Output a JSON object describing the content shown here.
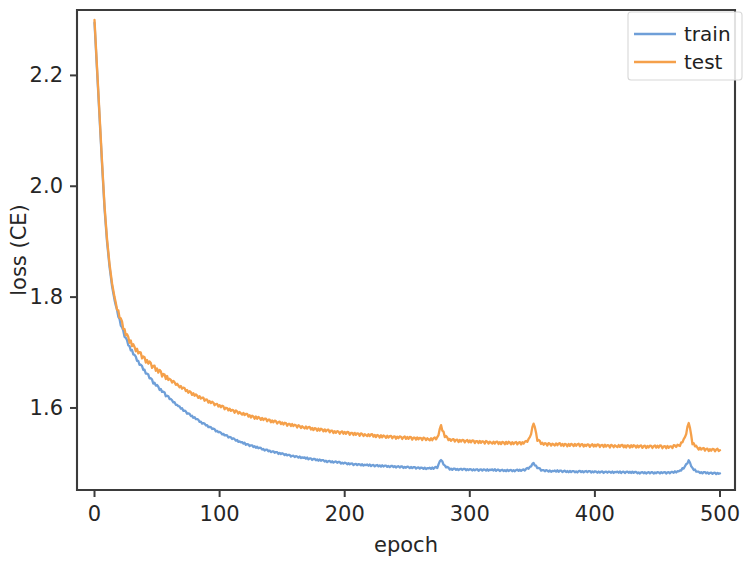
{
  "chart_data": {
    "type": "line",
    "title": "",
    "xlabel": "epoch",
    "ylabel": "loss (CE)",
    "xlim": [
      -14,
      512
    ],
    "ylim": [
      1.452,
      2.318
    ],
    "xticks": [
      0,
      100,
      200,
      300,
      400,
      500
    ],
    "xticklabels": [
      "0",
      "100",
      "200",
      "300",
      "400",
      "500"
    ],
    "yticks": [
      1.6,
      1.8,
      2.0,
      2.2
    ],
    "yticklabels": [
      "1.6",
      "1.8",
      "2.0",
      "2.2"
    ],
    "grid": false,
    "legend_position": "upper right",
    "colors": {
      "train": "#6f9fd8",
      "test": "#f5a council",
      "background": "#ffffff",
      "axis": "#3b3b3b",
      "text": "#262626"
    },
    "series": [
      {
        "name": "train",
        "color": "#6f9fd8",
        "x": [
          0,
          2,
          4,
          6,
          8,
          10,
          12,
          14,
          16,
          18,
          20,
          22,
          24,
          26,
          28,
          30,
          32,
          34,
          36,
          38,
          40,
          42,
          44,
          46,
          48,
          50,
          54,
          58,
          62,
          66,
          70,
          74,
          78,
          82,
          86,
          90,
          94,
          98,
          104,
          110,
          116,
          122,
          128,
          134,
          140,
          146,
          152,
          158,
          164,
          170,
          176,
          182,
          188,
          194,
          200,
          208,
          216,
          224,
          232,
          240,
          248,
          256,
          264,
          270,
          274,
          277,
          280,
          284,
          290,
          296,
          304,
          312,
          320,
          328,
          336,
          344,
          348,
          351,
          354,
          358,
          364,
          372,
          380,
          388,
          396,
          404,
          412,
          420,
          428,
          436,
          444,
          452,
          460,
          468,
          472,
          475,
          478,
          482,
          488,
          494,
          500
        ],
        "y": [
          2.295,
          2.21,
          2.125,
          2.04,
          1.96,
          1.9,
          1.855,
          1.82,
          1.795,
          1.775,
          1.758,
          1.744,
          1.731,
          1.72,
          1.71,
          1.702,
          1.694,
          1.687,
          1.68,
          1.673,
          1.667,
          1.661,
          1.655,
          1.649,
          1.644,
          1.639,
          1.63,
          1.621,
          1.613,
          1.605,
          1.598,
          1.591,
          1.585,
          1.579,
          1.573,
          1.568,
          1.563,
          1.558,
          1.551,
          1.545,
          1.539,
          1.534,
          1.53,
          1.526,
          1.522,
          1.519,
          1.516,
          1.513,
          1.511,
          1.509,
          1.507,
          1.505,
          1.503,
          1.502,
          1.5,
          1.498,
          1.497,
          1.496,
          1.495,
          1.494,
          1.493,
          1.492,
          1.491,
          1.491,
          1.493,
          1.507,
          1.495,
          1.49,
          1.489,
          1.489,
          1.488,
          1.488,
          1.488,
          1.487,
          1.487,
          1.488,
          1.493,
          1.5,
          1.492,
          1.487,
          1.486,
          1.486,
          1.485,
          1.485,
          1.485,
          1.484,
          1.484,
          1.484,
          1.484,
          1.483,
          1.483,
          1.483,
          1.483,
          1.486,
          1.494,
          1.505,
          1.491,
          1.484,
          1.483,
          1.482,
          1.482
        ]
      },
      {
        "name": "test",
        "color": "#f5a04a",
        "x": [
          0,
          2,
          4,
          6,
          8,
          10,
          12,
          14,
          16,
          18,
          20,
          22,
          24,
          26,
          28,
          30,
          32,
          34,
          36,
          38,
          40,
          42,
          44,
          46,
          48,
          50,
          54,
          58,
          62,
          66,
          70,
          74,
          78,
          82,
          86,
          90,
          94,
          98,
          104,
          110,
          116,
          122,
          128,
          134,
          140,
          146,
          152,
          158,
          164,
          170,
          176,
          182,
          188,
          194,
          200,
          208,
          216,
          224,
          232,
          240,
          248,
          256,
          264,
          270,
          274,
          277,
          280,
          284,
          290,
          296,
          304,
          312,
          320,
          328,
          336,
          344,
          348,
          351,
          354,
          358,
          364,
          372,
          380,
          388,
          396,
          404,
          412,
          420,
          428,
          436,
          444,
          452,
          460,
          468,
          472,
          475,
          478,
          482,
          488,
          494,
          500
        ],
        "y": [
          2.3,
          2.215,
          2.13,
          2.045,
          1.965,
          1.905,
          1.86,
          1.825,
          1.8,
          1.78,
          1.765,
          1.752,
          1.74,
          1.73,
          1.722,
          1.714,
          1.708,
          1.703,
          1.698,
          1.693,
          1.688,
          1.684,
          1.68,
          1.676,
          1.672,
          1.668,
          1.661,
          1.654,
          1.648,
          1.642,
          1.636,
          1.631,
          1.626,
          1.621,
          1.617,
          1.613,
          1.609,
          1.605,
          1.6,
          1.595,
          1.591,
          1.587,
          1.583,
          1.58,
          1.577,
          1.574,
          1.571,
          1.569,
          1.566,
          1.564,
          1.562,
          1.56,
          1.558,
          1.556,
          1.555,
          1.553,
          1.551,
          1.55,
          1.548,
          1.547,
          1.546,
          1.545,
          1.544,
          1.543,
          1.546,
          1.568,
          1.549,
          1.542,
          1.541,
          1.54,
          1.539,
          1.538,
          1.537,
          1.537,
          1.536,
          1.537,
          1.545,
          1.573,
          1.543,
          1.535,
          1.534,
          1.534,
          1.533,
          1.533,
          1.532,
          1.532,
          1.531,
          1.531,
          1.531,
          1.53,
          1.53,
          1.53,
          1.529,
          1.533,
          1.545,
          1.575,
          1.537,
          1.527,
          1.525,
          1.524,
          1.524
        ]
      }
    ],
    "noise": {
      "train": [
        0,
        0.0012,
        -0.0009,
        0.0015,
        -0.0013,
        0.0008,
        0.0011,
        -0.0014,
        0.0006,
        0.0013,
        -0.001,
        0.0009,
        -0.0012,
        0.0014,
        -0.0007,
        0.001,
        0.0012,
        -0.0011,
        0.0007,
        -0.0013,
        0.0009,
        0.0014,
        -0.0008,
        0.0011,
        -0.0012,
        0.0006,
        0.0013,
        -0.0009,
        0.001,
        0.0012,
        -0.0014,
        0.0008,
        -0.0007,
        0.0013,
        0.0009,
        -0.0011,
        0.0012,
        -0.0006,
        0.001,
        0.0014,
        -0.0013,
        0.0007,
        0.0011,
        -0.0009,
        0.0012,
        0.0008,
        -0.001,
        0.0013,
        -0.0012,
        0.0006
      ],
      "test": [
        0,
        -0.0016,
        0.0021,
        -0.0012,
        0.0018,
        0.0024,
        -0.0019,
        0.0013,
        -0.0022,
        0.0017,
        0.0011,
        -0.0024,
        0.002,
        -0.0014,
        0.0023,
        0.0012,
        -0.0018,
        0.0021,
        -0.0011,
        0.0016,
        0.0024,
        -0.002,
        0.0013,
        0.0019,
        -0.0023,
        0.0014,
        -0.0012,
        0.0022,
        0.0017,
        -0.0021,
        0.0011,
        0.0024,
        -0.0016,
        0.0018,
        -0.0013,
        0.0023,
        0.002,
        -0.0024,
        0.0012,
        0.0015,
        -0.0019,
        0.0021,
        -0.0011,
        0.0017,
        0.0013,
        -0.0022,
        0.0024,
        0.0014,
        -0.0018,
        0.0016
      ]
    }
  },
  "legend": {
    "entries": [
      {
        "label": "train",
        "color": "#6f9fd8"
      },
      {
        "label": "test",
        "color": "#f5a04a"
      }
    ]
  },
  "axes": {
    "x_title": "epoch",
    "y_title": "loss (CE)"
  }
}
